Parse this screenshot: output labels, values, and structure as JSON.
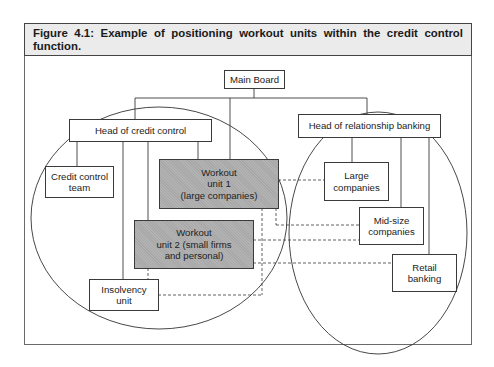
{
  "figure": {
    "title": "Figure 4.1: Example of positioning workout units within the credit control function."
  },
  "nodes": {
    "main_board": "Main Board",
    "head_credit_control": "Head of credit control",
    "head_relationship_banking": "Head of relationship banking",
    "credit_control_team": "Credit control\nteam",
    "workout_unit_1": "Workout\nunit 1\n(large companies)",
    "workout_unit_2": "Workout\nunit 2 (small firms\nand personal)",
    "insolvency_unit": "Insolvency\nunit",
    "large_companies": "Large\ncompanies",
    "mid_size_companies": "Mid-size\ncompanies",
    "retail_banking": "Retail\nbanking"
  },
  "colors": {
    "title_band": "#ebebeb",
    "workout_fill": "#a8a8a8",
    "line": "#3a3a3a"
  }
}
